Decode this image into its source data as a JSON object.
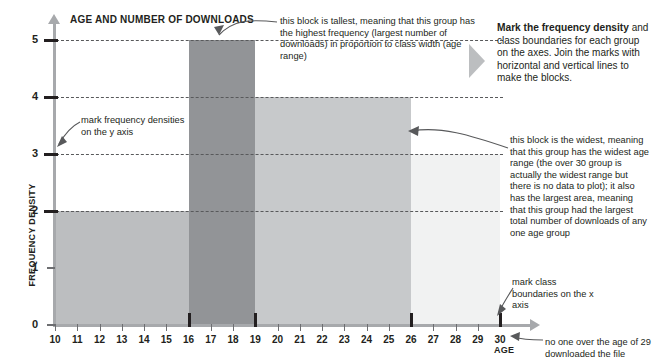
{
  "chart_data": {
    "type": "bar",
    "title": "AGE AND NUMBER OF DOWNLOADS",
    "xlabel": "AGE",
    "ylabel": "FREQUENCY DENSITY",
    "xlim": [
      10,
      30
    ],
    "ylim": [
      0,
      5
    ],
    "grid": true,
    "legend": "none",
    "x_ticks": [
      "10",
      "11",
      "12",
      "13",
      "14",
      "15",
      "16",
      "17",
      "18",
      "19",
      "20",
      "21",
      "22",
      "23",
      "24",
      "25",
      "26",
      "27",
      "28",
      "29",
      "30"
    ],
    "y_ticks": [
      "0",
      "1",
      "2",
      "3",
      "4",
      "5"
    ],
    "y_gridlines": [
      2,
      3,
      4,
      5
    ],
    "class_boundary_marks": [
      10,
      16,
      19,
      26,
      30
    ],
    "bars": [
      {
        "name": "bar-10-16",
        "x_start": 10,
        "x_end": 16,
        "frequency_density": 2,
        "color": "#bcbec0"
      },
      {
        "name": "bar-16-19",
        "x_start": 16,
        "x_end": 19,
        "frequency_density": 5,
        "color": "#929497"
      },
      {
        "name": "bar-19-26",
        "x_start": 19,
        "x_end": 26,
        "frequency_density": 4,
        "color": "#c7c9cb"
      },
      {
        "name": "bar-26-30",
        "x_start": 26,
        "x_end": 30,
        "frequency_density": 3,
        "color": "#f1f2f2"
      }
    ]
  },
  "chart": {
    "title": "AGE AND NUMBER OF DOWNLOADS",
    "x_axis_title": "AGE",
    "y_axis_title": "FREQUENCY DENSITY"
  },
  "annotations": {
    "tallest": "this block is tallest, meaning that this group has the highest frequency (largest number of downloads) in proportion to class width (age range)",
    "y_axis_marks": "mark frequency densities on the y axis",
    "widest": "this block is the widest, meaning that this group has the widest age range (the over 30 group is actually the widest range but there is no data to plot); it also has the largest area, meaning that this group had the largest total number of downloads of any one age group",
    "class_boundaries": "mark class boundaries on the x axis",
    "no_one": "no one over the age of 29 downloaded the file"
  },
  "callout": {
    "bold_lead": "Mark the frequency density",
    "body": " and class boundaries for each group on the axes. Join the marks with horizontal and vertical lines to make the blocks."
  },
  "colors": {
    "bar_1": "#bcbec0",
    "bar_2": "#929497",
    "bar_3": "#c7c9cb",
    "bar_4": "#f1f2f2",
    "axis": "#a7a9ac",
    "text": "#231f20"
  }
}
